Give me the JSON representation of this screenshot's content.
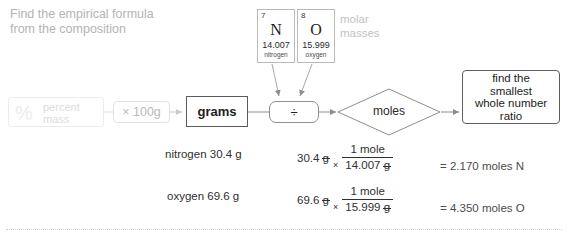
{
  "heading": "Find the empirical formula\nfrom the composition",
  "elements": [
    {
      "number": "7",
      "symbol": "N",
      "mass": "14.007",
      "name": "nitrogen"
    },
    {
      "number": "8",
      "symbol": "O",
      "mass": "15.999",
      "name": "oxygen"
    }
  ],
  "molar_masses_label": "molar\nmasses",
  "flow": {
    "percent_box": {
      "symbol": "%",
      "label": "percent\nmass"
    },
    "multiply_box": "× 100g",
    "grams_box": "grams",
    "divide_box": "÷",
    "moles_diamond": "moles",
    "final_box": "find the\nsmallest\nwhole number\nratio"
  },
  "calculations": [
    {
      "label": "nitrogen 30.4 g",
      "quantity_value": "30.4",
      "quantity_unit": "g",
      "numerator": "1 mole",
      "denominator_value": "14.007",
      "denominator_unit": "g",
      "times": "×",
      "result": "= 2.170 moles N"
    },
    {
      "label": "oxygen 69.6 g",
      "quantity_value": "69.6",
      "quantity_unit": "g",
      "numerator": "1 mole",
      "denominator_value": "15.999",
      "denominator_unit": "g",
      "times": "×",
      "result": "= 4.350 moles O"
    }
  ],
  "colors": {
    "faded_text": "#c2c2c2",
    "body_text": "#303030",
    "box_border": "#5f5f5f"
  }
}
